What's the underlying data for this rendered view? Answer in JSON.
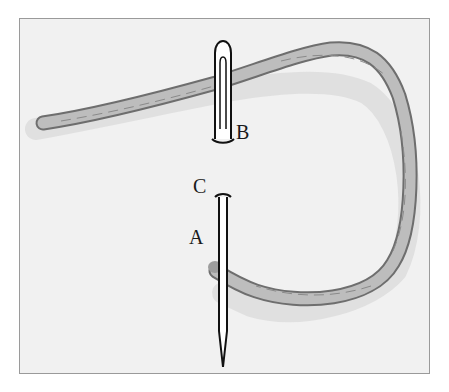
{
  "diagram": {
    "type": "illustration",
    "labels": {
      "a": "A",
      "b": "B",
      "c": "C"
    },
    "colors": {
      "background": "#f1f1f1",
      "frame_border": "#9a9a9a",
      "thread_fill": "#bdbdbd",
      "thread_outline": "#6e6e6e",
      "shadow": "#dedede",
      "needle": "#111111"
    }
  }
}
